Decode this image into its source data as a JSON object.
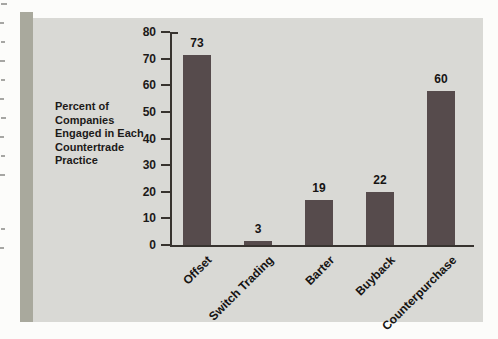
{
  "figure": {
    "panel_color": "#d9d9d5",
    "strip_color": "#a9a99d",
    "bar_color": "#564b4c",
    "axis_color": "#37332f",
    "text_color": "#1c1a19",
    "page_color": "#fcfcfa",
    "ylabel_lines": [
      "Percent of",
      "Companies",
      "Engaged in Each",
      "Countertrade",
      "Practice"
    ]
  },
  "chart_data": {
    "type": "bar",
    "title": "",
    "categories": [
      "Offset",
      "Switch Trading",
      "Barter",
      "Buyback",
      "Counterpurchase"
    ],
    "values": [
      73,
      3,
      19,
      22,
      60
    ],
    "drawn_values": [
      71.5,
      1.5,
      17,
      20,
      58
    ],
    "xlabel": "",
    "ylabel": "Percent of Companies Engaged in Each Countertrade Practice",
    "ylim": [
      0,
      80
    ],
    "yticks": [
      0,
      10,
      20,
      30,
      40,
      50,
      60,
      70,
      80
    ],
    "grid": false,
    "legend": null,
    "bar_value_labels_shown": true,
    "category_label_rotation_deg": -45
  }
}
